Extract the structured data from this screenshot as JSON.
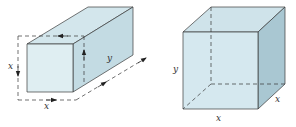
{
  "figures": [
    {
      "id": "elongated-box",
      "description": "Rectangular box with square cross-section x by x and length y, dashed arrows showing dimensions",
      "labels": {
        "front_height": "x",
        "front_width": "x",
        "length": "y"
      }
    },
    {
      "id": "cube-like-box",
      "description": "Box with square base x by x and height y, hidden edges dashed",
      "labels": {
        "height": "y",
        "base_front": "x",
        "base_depth": "x"
      }
    }
  ],
  "colors": {
    "face_front": "#dbecf1",
    "face_top": "#cfe3ea",
    "face_side": "#b9d3dc",
    "edge": "#3a3a3a",
    "dash": "#333333"
  }
}
